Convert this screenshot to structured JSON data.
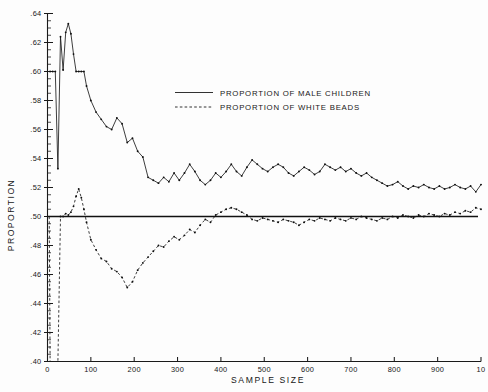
{
  "chart_data": {
    "type": "line",
    "title": "",
    "xlabel": "SAMPLE SIZE",
    "ylabel": "PROPORTION",
    "xlim": [
      0,
      1000
    ],
    "ylim": [
      0.4,
      0.64
    ],
    "grid": false,
    "legend_position": "upper-center",
    "reference_line": {
      "label": "0.50 reference",
      "y": 0.5,
      "x_start": 0,
      "x_end": 1000
    },
    "xticks": [
      0,
      100,
      200,
      300,
      400,
      500,
      600,
      700,
      800,
      900,
      1000
    ],
    "xticklabels": [
      "0",
      "100",
      "200",
      "300",
      "400",
      "500",
      "600",
      "700",
      "800",
      "900",
      "10"
    ],
    "yticks": [
      0.4,
      0.42,
      0.44,
      0.46,
      0.48,
      0.5,
      0.52,
      0.54,
      0.56,
      0.58,
      0.6,
      0.62,
      0.64
    ],
    "yticklabels": [
      ".40",
      ".42",
      ".44",
      ".46",
      ".48",
      ".50",
      ".52",
      ".54",
      ".56",
      ".58",
      ".60",
      ".62",
      ".64"
    ],
    "yminor_step": 0.005,
    "series": [
      {
        "name": "PROPORTION OF MALE CHILDREN",
        "style": "solid",
        "x": [
          6,
          12,
          18,
          24,
          30,
          36,
          42,
          48,
          54,
          60,
          66,
          72,
          78,
          84,
          90,
          100,
          112,
          124,
          136,
          148,
          160,
          172,
          184,
          196,
          208,
          220,
          232,
          244,
          256,
          268,
          280,
          292,
          304,
          316,
          328,
          340,
          352,
          364,
          376,
          388,
          400,
          412,
          424,
          436,
          448,
          460,
          472,
          484,
          496,
          508,
          520,
          532,
          544,
          556,
          568,
          580,
          592,
          604,
          616,
          628,
          640,
          652,
          664,
          676,
          688,
          700,
          712,
          724,
          736,
          748,
          760,
          772,
          784,
          796,
          808,
          820,
          832,
          844,
          856,
          868,
          880,
          892,
          904,
          916,
          928,
          940,
          952,
          964,
          976,
          988,
          1000
        ],
        "y": [
          0.6,
          0.6,
          0.6,
          0.533,
          0.624,
          0.601,
          0.627,
          0.633,
          0.626,
          0.612,
          0.6,
          0.6,
          0.6,
          0.6,
          0.59,
          0.58,
          0.572,
          0.567,
          0.562,
          0.56,
          0.568,
          0.564,
          0.551,
          0.554,
          0.545,
          0.541,
          0.527,
          0.525,
          0.523,
          0.527,
          0.524,
          0.53,
          0.525,
          0.53,
          0.536,
          0.531,
          0.525,
          0.522,
          0.525,
          0.53,
          0.527,
          0.531,
          0.536,
          0.531,
          0.528,
          0.534,
          0.539,
          0.536,
          0.533,
          0.531,
          0.534,
          0.536,
          0.534,
          0.53,
          0.528,
          0.531,
          0.534,
          0.532,
          0.529,
          0.531,
          0.536,
          0.534,
          0.532,
          0.534,
          0.531,
          0.533,
          0.53,
          0.528,
          0.53,
          0.527,
          0.525,
          0.523,
          0.521,
          0.522,
          0.524,
          0.521,
          0.519,
          0.521,
          0.52,
          0.522,
          0.52,
          0.519,
          0.521,
          0.519,
          0.52,
          0.522,
          0.52,
          0.519,
          0.521,
          0.517,
          0.522
        ]
      },
      {
        "name": "PROPORTION OF WHITE BEADS",
        "style": "dashed",
        "x": [
          4,
          6,
          12,
          18,
          24,
          30,
          36,
          42,
          48,
          54,
          60,
          66,
          72,
          78,
          84,
          90,
          100,
          112,
          124,
          136,
          148,
          160,
          172,
          184,
          196,
          208,
          220,
          232,
          244,
          256,
          268,
          280,
          292,
          304,
          316,
          328,
          340,
          352,
          364,
          376,
          388,
          400,
          412,
          424,
          436,
          448,
          460,
          472,
          484,
          496,
          508,
          520,
          532,
          544,
          556,
          568,
          580,
          592,
          604,
          616,
          628,
          640,
          652,
          664,
          676,
          688,
          700,
          712,
          724,
          736,
          748,
          760,
          772,
          784,
          796,
          808,
          820,
          832,
          844,
          856,
          868,
          880,
          892,
          904,
          916,
          928,
          940,
          952,
          964,
          976,
          988,
          1000
        ],
        "y": [
          0.5,
          0.4,
          0.4,
          0.4,
          0.4,
          0.5,
          0.5,
          0.502,
          0.501,
          0.503,
          0.507,
          0.514,
          0.519,
          0.513,
          0.505,
          0.496,
          0.484,
          0.477,
          0.471,
          0.469,
          0.464,
          0.462,
          0.458,
          0.451,
          0.455,
          0.463,
          0.468,
          0.472,
          0.476,
          0.48,
          0.479,
          0.483,
          0.486,
          0.484,
          0.487,
          0.491,
          0.489,
          0.494,
          0.498,
          0.496,
          0.501,
          0.503,
          0.505,
          0.506,
          0.505,
          0.503,
          0.501,
          0.498,
          0.497,
          0.499,
          0.498,
          0.497,
          0.496,
          0.498,
          0.497,
          0.496,
          0.494,
          0.496,
          0.498,
          0.497,
          0.499,
          0.498,
          0.497,
          0.499,
          0.498,
          0.497,
          0.499,
          0.498,
          0.5,
          0.499,
          0.498,
          0.497,
          0.499,
          0.498,
          0.5,
          0.499,
          0.501,
          0.5,
          0.499,
          0.501,
          0.5,
          0.502,
          0.501,
          0.5,
          0.502,
          0.501,
          0.503,
          0.502,
          0.504,
          0.503,
          0.506,
          0.505
        ]
      }
    ]
  },
  "legend": {
    "entries": [
      {
        "label": "PROPORTION OF MALE CHILDREN",
        "style": "solid"
      },
      {
        "label": "PROPORTION OF WHITE BEADS",
        "style": "dashed"
      }
    ]
  },
  "axes": {
    "x_title": "SAMPLE SIZE",
    "y_title": "PROPORTION"
  }
}
